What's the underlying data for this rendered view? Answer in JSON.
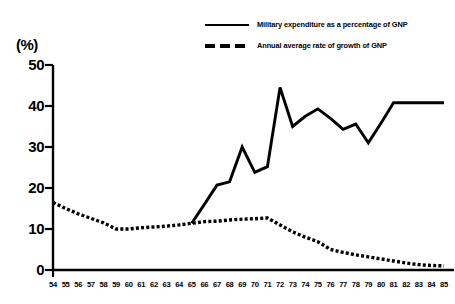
{
  "legend": {
    "items": [
      {
        "label": "Military expenditure as a percentage of GNP",
        "style": "solid",
        "icon": "solid-line-swatch"
      },
      {
        "label": "Annual average rate of growth of GNP",
        "style": "dashed",
        "icon": "dashed-line-swatch"
      }
    ]
  },
  "axis": {
    "y_unit": "(%)",
    "y_ticks": [
      "0",
      "10",
      "20",
      "30",
      "40",
      "50"
    ]
  },
  "chart_data": {
    "type": "line",
    "title": "",
    "xlabel": "",
    "ylabel": "(%)",
    "ylim": [
      0,
      50
    ],
    "yticks": [
      0,
      10,
      20,
      30,
      40,
      50
    ],
    "grid": false,
    "legend_position": "top-right",
    "categories": [
      "54",
      "55",
      "56",
      "57",
      "58",
      "59",
      "60",
      "61",
      "62",
      "63",
      "64",
      "65",
      "66",
      "67",
      "68",
      "69",
      "70",
      "71",
      "72",
      "73",
      "74",
      "75",
      "76",
      "77",
      "78",
      "79",
      "80",
      "81",
      "82",
      "83",
      "84",
      "85"
    ],
    "series": [
      {
        "name": "Military expenditure as a percentage of GNP",
        "style": "solid",
        "x": [
          "65",
          "66",
          "67",
          "68",
          "69",
          "70",
          "71",
          "72",
          "73",
          "74",
          "75",
          "76",
          "77",
          "78",
          "79",
          "80",
          "81",
          "82",
          "83",
          "84",
          "85"
        ],
        "values": [
          11.4,
          16.0,
          20.7,
          21.5,
          30.0,
          23.8,
          25.2,
          44.5,
          35.0,
          37.5,
          39.3,
          37.0,
          34.3,
          35.6,
          31.0,
          35.8,
          40.8,
          40.8,
          40.8,
          40.8,
          40.8
        ]
      },
      {
        "name": "Annual average rate of growth of GNP",
        "style": "dashed",
        "x": [
          "54",
          "55",
          "56",
          "57",
          "58",
          "59",
          "60",
          "61",
          "62",
          "63",
          "64",
          "65",
          "66",
          "67",
          "68",
          "69",
          "70",
          "71",
          "72",
          "73",
          "74",
          "75",
          "76",
          "77",
          "78",
          "79",
          "80",
          "81",
          "82",
          "83",
          "84",
          "85"
        ],
        "values": [
          16.5,
          15.0,
          13.7,
          12.6,
          11.5,
          10.0,
          10.0,
          10.3,
          10.5,
          10.7,
          11.0,
          11.4,
          11.8,
          11.9,
          12.2,
          12.4,
          12.5,
          12.7,
          11.0,
          9.3,
          8.0,
          6.9,
          5.0,
          4.3,
          3.7,
          3.2,
          2.7,
          2.2,
          1.7,
          1.3,
          1.1,
          1.0
        ]
      }
    ]
  },
  "colors": {
    "line": "#000000",
    "axis": "#000000",
    "background": "#ffffff"
  }
}
